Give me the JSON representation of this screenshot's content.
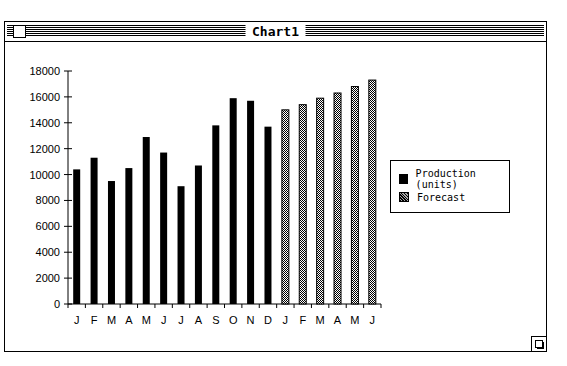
{
  "window": {
    "title": "Chart1"
  },
  "legend": {
    "items": [
      {
        "label": "Production (units)",
        "style": "solid"
      },
      {
        "label": "Forecast",
        "style": "pattern"
      }
    ]
  },
  "chart_data": {
    "type": "bar",
    "title": "",
    "xlabel": "",
    "ylabel": "",
    "ylim": [
      0,
      18000
    ],
    "yticks": [
      0,
      2000,
      4000,
      6000,
      8000,
      10000,
      12000,
      14000,
      16000,
      18000
    ],
    "categories": [
      "J",
      "F",
      "M",
      "A",
      "M",
      "J",
      "J",
      "A",
      "S",
      "O",
      "N",
      "D",
      "J",
      "F",
      "M",
      "A",
      "M",
      "J"
    ],
    "series": [
      {
        "name": "Production (units)",
        "color": "#000000",
        "values": [
          10400,
          11300,
          9500,
          10500,
          12900,
          11700,
          9100,
          10700,
          13800,
          15900,
          15700,
          13700,
          null,
          null,
          null,
          null,
          null,
          null
        ]
      },
      {
        "name": "Forecast",
        "color": "#555555",
        "values": [
          null,
          null,
          null,
          null,
          null,
          null,
          null,
          null,
          null,
          null,
          null,
          null,
          15000,
          15400,
          15900,
          16300,
          16800,
          17300
        ]
      }
    ],
    "grid": false,
    "legend_position": "right"
  }
}
